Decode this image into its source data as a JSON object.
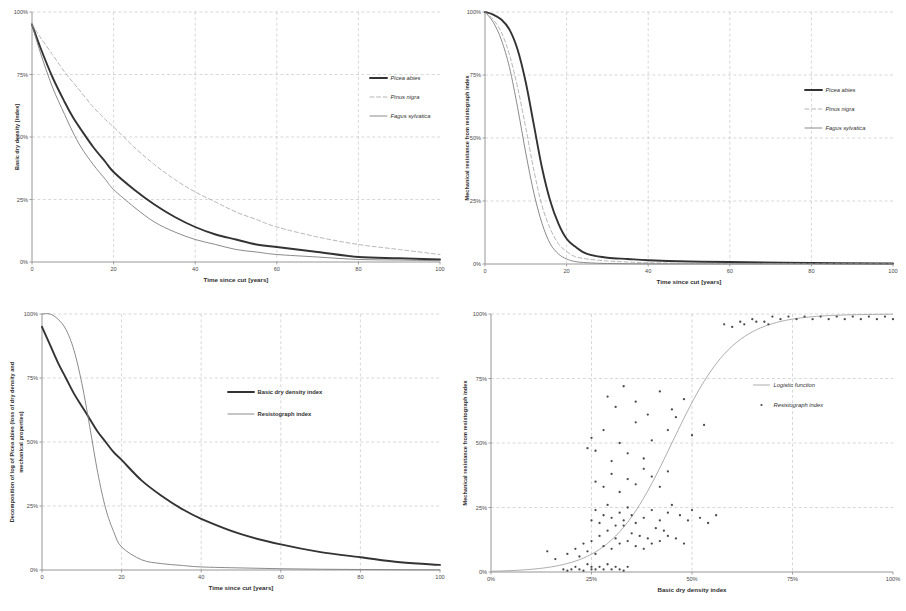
{
  "figure": {
    "panel_count": 4
  },
  "panels": {
    "top_left": {
      "name": "basic-dry-density-decay",
      "x_title": "Time since cut [years]",
      "y_title": "Basic dry density [index]",
      "x_ticks": [
        "0",
        "20",
        "40",
        "60",
        "80",
        "100"
      ],
      "y_ticks": [
        "0%",
        "25%",
        "50%",
        "75%",
        "100%"
      ],
      "legend": [
        {
          "label": "Picea abies",
          "style": "thick"
        },
        {
          "label": "Pinus nigra",
          "style": "dashed"
        },
        {
          "label": "Fagus sylvatica",
          "style": "thin"
        }
      ]
    },
    "top_right": {
      "name": "mechanical-resistance-decay",
      "x_title": "Time since cut [years]",
      "y_title": "Mechanical resistance from resistograph index",
      "x_ticks": [
        "0",
        "20",
        "40",
        "60",
        "80",
        "100"
      ],
      "y_ticks": [
        "0%",
        "25%",
        "50%",
        "75%",
        "100%"
      ],
      "legend": [
        {
          "label": "Picea abies",
          "style": "thick"
        },
        {
          "label": "Pinus nigra",
          "style": "dashed"
        },
        {
          "label": "Fagus sylvatica",
          "style": "thin"
        }
      ]
    },
    "bottom_left": {
      "name": "picea-abies-decomposition",
      "x_title": "Time since cut [years]",
      "y_title": "Decomposition of log of Picea abies (loss of dry density and mechanical properties)",
      "x_ticks": [
        "0",
        "20",
        "40",
        "60",
        "80",
        "100"
      ],
      "y_ticks": [
        "0%",
        "25%",
        "50%",
        "75%",
        "100%"
      ],
      "legend": [
        {
          "label": "Basic dry density index",
          "style": "thick"
        },
        {
          "label": "Resistograph index",
          "style": "thin"
        }
      ]
    },
    "bottom_right": {
      "name": "resistograph-vs-density-scatter",
      "x_title": "Basic dry density index",
      "y_title": "Mechanical resistance from resistograph index",
      "x_ticks": [
        "0%",
        "25%",
        "50%",
        "75%",
        "100%"
      ],
      "y_ticks": [
        "0%",
        "25%",
        "50%",
        "75%",
        "100%"
      ],
      "legend": [
        {
          "label": "Logistic function",
          "style": "line"
        },
        {
          "label": "Resistograph index",
          "style": "points"
        }
      ]
    }
  },
  "chart_data": [
    {
      "type": "line",
      "panel": "top_left",
      "title": "Basic dry density decay over time",
      "xlabel": "Time since cut [years]",
      "ylabel": "Basic dry density [index]",
      "xlim": [
        0,
        100
      ],
      "ylim": [
        0,
        100
      ],
      "grid": true,
      "legend_position": "right-upper",
      "x": [
        0,
        2,
        5,
        8,
        10,
        12,
        15,
        18,
        20,
        25,
        30,
        35,
        40,
        45,
        50,
        55,
        60,
        70,
        80,
        90,
        100
      ],
      "series": [
        {
          "name": "Picea abies",
          "style": "thick-solid",
          "values": [
            95,
            86,
            74,
            64,
            58,
            53,
            46,
            40,
            36,
            29,
            23,
            18,
            14,
            11,
            9,
            7,
            6,
            4,
            2,
            1.5,
            1
          ]
        },
        {
          "name": "Pinus nigra",
          "style": "dashed",
          "values": [
            95,
            90,
            83,
            76,
            72,
            68,
            62,
            57,
            54,
            46,
            39,
            33,
            28,
            24,
            20,
            17,
            14,
            10,
            7,
            5,
            3
          ]
        },
        {
          "name": "Fagus sylvatica",
          "style": "thin-solid",
          "values": [
            95,
            84,
            70,
            59,
            52,
            46,
            39,
            33,
            29,
            22,
            16,
            12,
            9,
            7,
            5,
            4,
            3,
            2,
            1,
            0.8,
            0.5
          ]
        }
      ]
    },
    {
      "type": "line",
      "panel": "top_right",
      "title": "Mechanical resistance decay over time",
      "xlabel": "Time since cut [years]",
      "ylabel": "Mechanical resistance from resistograph index",
      "xlim": [
        0,
        100
      ],
      "ylim": [
        0,
        100
      ],
      "grid": true,
      "legend_position": "right-upper",
      "x": [
        0,
        2,
        4,
        6,
        8,
        10,
        12,
        14,
        16,
        18,
        20,
        22,
        25,
        30,
        35,
        40,
        50,
        60,
        80,
        100
      ],
      "series": [
        {
          "name": "Picea abies",
          "style": "thick-solid",
          "values": [
            100,
            99,
            97,
            93,
            85,
            72,
            55,
            38,
            25,
            16,
            10,
            7,
            4,
            2.5,
            2,
            1.5,
            1,
            0.8,
            0.4,
            0.2
          ]
        },
        {
          "name": "Pinus nigra",
          "style": "dashed",
          "values": [
            100,
            97,
            92,
            83,
            70,
            54,
            37,
            23,
            14,
            8,
            5,
            3,
            2,
            1.2,
            0.8,
            0.5,
            0.3,
            0.2,
            0.1,
            0.05
          ]
        },
        {
          "name": "Fagus sylvatica",
          "style": "thin-solid",
          "values": [
            100,
            96,
            89,
            78,
            62,
            44,
            28,
            16,
            8,
            4,
            2,
            1,
            0.5,
            0.2,
            0.1,
            0.05,
            0.02,
            0.01,
            0,
            0
          ]
        }
      ]
    },
    {
      "type": "line",
      "panel": "bottom_left",
      "title": "Decomposition of log of Picea abies",
      "xlabel": "Time since cut [years]",
      "ylabel": "Decomposition of log of Picea abies (loss of dry density and mechanical properties)",
      "xlim": [
        0,
        100
      ],
      "ylim": [
        0,
        100
      ],
      "grid": true,
      "legend_position": "center-upper",
      "x": [
        0,
        2,
        4,
        6,
        8,
        10,
        12,
        14,
        16,
        18,
        20,
        25,
        30,
        35,
        40,
        50,
        60,
        70,
        80,
        90,
        100
      ],
      "series": [
        {
          "name": "Basic dry density index",
          "style": "thick-solid",
          "values": [
            95,
            88,
            81,
            75,
            69,
            64,
            59,
            54,
            50,
            46,
            43,
            35,
            29,
            24,
            20,
            14,
            10,
            7,
            5,
            3,
            2
          ]
        },
        {
          "name": "Resistograph index",
          "style": "thin-solid",
          "values": [
            100,
            100,
            98,
            94,
            86,
            73,
            56,
            38,
            24,
            15,
            9,
            4,
            2.5,
            1.8,
            1.2,
            0.8,
            0.5,
            0.3,
            0.2,
            0.1,
            0.05
          ]
        }
      ]
    },
    {
      "type": "scatter",
      "panel": "bottom_right",
      "title": "Mechanical resistance vs basic dry density",
      "xlabel": "Basic dry density index",
      "ylabel": "Mechanical resistance from resistograph index",
      "xlim": [
        0,
        100
      ],
      "ylim": [
        0,
        100
      ],
      "grid": true,
      "legend_position": "right-upper",
      "series": [
        {
          "name": "Logistic function",
          "style": "line",
          "formula": "sigmoid centered near 45% dry density",
          "midpoint": 45,
          "steepness": 0.13
        },
        {
          "name": "Resistograph index",
          "style": "points",
          "points": [
            [
              18,
              1
            ],
            [
              19,
              0.5
            ],
            [
              20,
              1
            ],
            [
              21,
              2
            ],
            [
              22,
              1
            ],
            [
              23,
              0.5
            ],
            [
              24,
              3
            ],
            [
              25,
              1
            ],
            [
              25,
              2
            ],
            [
              26,
              1
            ],
            [
              27,
              2
            ],
            [
              28,
              1
            ],
            [
              29,
              3
            ],
            [
              30,
              1
            ],
            [
              31,
              2
            ],
            [
              32,
              1
            ],
            [
              33,
              0.5
            ],
            [
              34,
              2
            ],
            [
              14,
              8
            ],
            [
              16,
              5
            ],
            [
              19,
              7
            ],
            [
              21,
              9
            ],
            [
              22,
              6
            ],
            [
              23,
              11
            ],
            [
              24,
              8
            ],
            [
              25,
              12
            ],
            [
              26,
              7
            ],
            [
              27,
              14
            ],
            [
              28,
              10
            ],
            [
              29,
              16
            ],
            [
              30,
              9
            ],
            [
              31,
              13
            ],
            [
              32,
              11
            ],
            [
              33,
              18
            ],
            [
              34,
              12
            ],
            [
              35,
              15
            ],
            [
              36,
              10
            ],
            [
              37,
              14
            ],
            [
              38,
              9
            ],
            [
              39,
              13
            ],
            [
              40,
              11
            ],
            [
              41,
              17
            ],
            [
              42,
              12
            ],
            [
              43,
              16
            ],
            [
              44,
              14
            ],
            [
              46,
              13
            ],
            [
              48,
              11
            ],
            [
              25,
              20
            ],
            [
              26,
              24
            ],
            [
              27,
              19
            ],
            [
              28,
              22
            ],
            [
              29,
              26
            ],
            [
              30,
              21
            ],
            [
              31,
              18
            ],
            [
              32,
              23
            ],
            [
              33,
              20
            ],
            [
              34,
              25
            ],
            [
              35,
              22
            ],
            [
              36,
              19
            ],
            [
              38,
              21
            ],
            [
              40,
              24
            ],
            [
              42,
              20
            ],
            [
              44,
              23
            ],
            [
              45,
              26
            ],
            [
              47,
              22
            ],
            [
              49,
              20
            ],
            [
              50,
              24
            ],
            [
              52,
              21
            ],
            [
              54,
              19
            ],
            [
              56,
              22
            ],
            [
              26,
              35
            ],
            [
              28,
              33
            ],
            [
              30,
              38
            ],
            [
              32,
              31
            ],
            [
              34,
              36
            ],
            [
              36,
              34
            ],
            [
              38,
              40
            ],
            [
              40,
              37
            ],
            [
              42,
              33
            ],
            [
              44,
              39
            ],
            [
              24,
              48
            ],
            [
              25,
              52
            ],
            [
              26,
              47
            ],
            [
              28,
              55
            ],
            [
              30,
              43
            ],
            [
              32,
              50
            ],
            [
              34,
              46
            ],
            [
              36,
              58
            ],
            [
              38,
              44
            ],
            [
              40,
              51
            ],
            [
              29,
              68
            ],
            [
              31,
              64
            ],
            [
              33,
              72
            ],
            [
              36,
              66
            ],
            [
              39,
              61
            ],
            [
              42,
              70
            ],
            [
              45,
              63
            ],
            [
              48,
              67
            ],
            [
              44,
              55
            ],
            [
              46,
              60
            ],
            [
              50,
              53
            ],
            [
              53,
              57
            ],
            [
              58,
              96
            ],
            [
              62,
              97
            ],
            [
              65,
              98
            ],
            [
              68,
              97
            ],
            [
              70,
              99
            ],
            [
              72,
              98
            ],
            [
              74,
              99
            ],
            [
              76,
              98
            ],
            [
              78,
              99
            ],
            [
              80,
              98
            ],
            [
              82,
              99
            ],
            [
              84,
              98
            ],
            [
              86,
              99
            ],
            [
              88,
              98
            ],
            [
              90,
              99
            ],
            [
              92,
              98
            ],
            [
              94,
              99
            ],
            [
              96,
              98
            ],
            [
              98,
              99
            ],
            [
              100,
              98
            ],
            [
              60,
              95
            ],
            [
              63,
              96
            ],
            [
              66,
              97
            ],
            [
              69,
              96
            ]
          ]
        }
      ]
    }
  ]
}
